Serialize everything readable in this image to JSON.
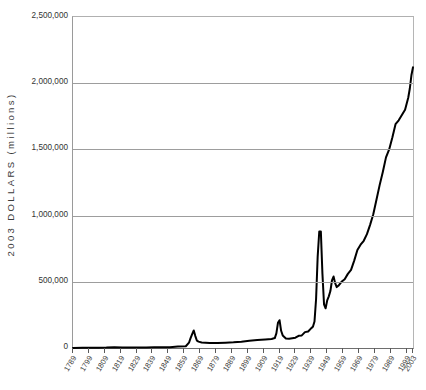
{
  "chart_data": {
    "type": "line",
    "title": "",
    "xlabel": "",
    "ylabel": "2003 DOLLARS (millions)",
    "ylim": [
      0,
      2500000
    ],
    "xlim": [
      1789,
      2003
    ],
    "grid": true,
    "legend": null,
    "y_ticks": [
      {
        "value": 2500000,
        "label": "2,500,000"
      },
      {
        "value": 2000000,
        "label": "2,000,000"
      },
      {
        "value": 1500000,
        "label": "1,500,000"
      },
      {
        "value": 1000000,
        "label": "1,000,000"
      },
      {
        "value": 500000,
        "label": "500,000"
      },
      {
        "value": 0,
        "label": "0"
      }
    ],
    "x_ticks": [
      {
        "value": 1789,
        "label": "1789"
      },
      {
        "value": 1799,
        "label": "1799"
      },
      {
        "value": 1809,
        "label": "1809"
      },
      {
        "value": 1819,
        "label": "1819"
      },
      {
        "value": 1829,
        "label": "1829"
      },
      {
        "value": 1839,
        "label": "1839"
      },
      {
        "value": 1849,
        "label": "1849"
      },
      {
        "value": 1859,
        "label": "1859"
      },
      {
        "value": 1869,
        "label": "1869"
      },
      {
        "value": 1879,
        "label": "1879"
      },
      {
        "value": 1889,
        "label": "1889"
      },
      {
        "value": 1899,
        "label": "1899"
      },
      {
        "value": 1909,
        "label": "1909"
      },
      {
        "value": 1919,
        "label": "1919"
      },
      {
        "value": 1929,
        "label": "1929"
      },
      {
        "value": 1939,
        "label": "1939"
      },
      {
        "value": 1949,
        "label": "1949"
      },
      {
        "value": 1959,
        "label": "1959"
      },
      {
        "value": 1969,
        "label": "1969"
      },
      {
        "value": 1979,
        "label": "1979"
      },
      {
        "value": 1989,
        "label": "1989"
      },
      {
        "value": 1999,
        "label": "1999"
      },
      {
        "value": 2003,
        "label": "2003"
      }
    ],
    "series": [
      {
        "name": "Federal outlays",
        "color": "#000000",
        "x": [
          1789,
          1795,
          1800,
          1805,
          1810,
          1815,
          1820,
          1825,
          1830,
          1835,
          1840,
          1845,
          1850,
          1855,
          1860,
          1862,
          1863,
          1864,
          1865,
          1866,
          1867,
          1868,
          1870,
          1875,
          1880,
          1885,
          1890,
          1895,
          1900,
          1905,
          1910,
          1914,
          1916,
          1917,
          1918,
          1919,
          1920,
          1921,
          1923,
          1925,
          1929,
          1931,
          1933,
          1935,
          1937,
          1939,
          1940,
          1941,
          1942,
          1943,
          1944,
          1945,
          1946,
          1947,
          1948,
          1949,
          1950,
          1951,
          1952,
          1953,
          1954,
          1955,
          1956,
          1958,
          1960,
          1962,
          1964,
          1966,
          1968,
          1970,
          1972,
          1974,
          1976,
          1978,
          1980,
          1982,
          1984,
          1986,
          1988,
          1990,
          1992,
          1994,
          1996,
          1998,
          2000,
          2001,
          2002,
          2003
        ],
        "y": [
          800,
          1500,
          2000,
          2500,
          3000,
          6000,
          4000,
          4500,
          4000,
          4500,
          5000,
          5500,
          6000,
          11000,
          13000,
          40000,
          75000,
          105000,
          132000,
          90000,
          55000,
          48000,
          42000,
          38000,
          38000,
          40000,
          43000,
          48000,
          55000,
          60000,
          65000,
          68000,
          75000,
          110000,
          190000,
          210000,
          130000,
          95000,
          72000,
          70000,
          78000,
          92000,
          95000,
          120000,
          125000,
          150000,
          160000,
          200000,
          370000,
          690000,
          880000,
          880000,
          560000,
          330000,
          300000,
          360000,
          390000,
          430000,
          510000,
          540000,
          490000,
          460000,
          470000,
          500000,
          520000,
          560000,
          590000,
          660000,
          740000,
          780000,
          810000,
          860000,
          930000,
          1010000,
          1120000,
          1230000,
          1330000,
          1440000,
          1500000,
          1590000,
          1690000,
          1720000,
          1760000,
          1800000,
          1890000,
          1960000,
          2060000,
          2120000
        ]
      }
    ],
    "annotations": []
  }
}
